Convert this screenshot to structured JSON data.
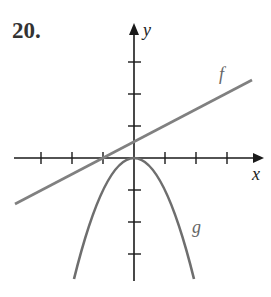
{
  "problem_number": "20.",
  "axes": {
    "x_label": "x",
    "y_label": "y",
    "x_ticks": [
      -3,
      -2,
      -1,
      1,
      2,
      3
    ],
    "y_ticks": [
      -3,
      -2,
      -1,
      1,
      2,
      3
    ]
  },
  "curves": {
    "f": {
      "label": "f",
      "type": "line",
      "equation": "y = 0.5x + 0.5",
      "color": "#808080"
    },
    "g": {
      "label": "g",
      "type": "parabola",
      "equation": "y = -x^2",
      "color": "#707070"
    }
  },
  "colors": {
    "axis": "#1a1a1a",
    "f_line": "#808080",
    "g_curve": "#6e6e6e",
    "label": "#555555"
  }
}
